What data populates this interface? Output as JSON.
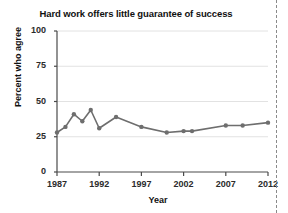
{
  "figure": {
    "title": "Hard work offers little guarantee of success",
    "page_edge": "dashed-page-border"
  },
  "chart_data": {
    "type": "line",
    "title": "Hard work offers little guarantee of success",
    "xlabel": "Year",
    "ylabel": "Percent who agree",
    "xlim": [
      1987,
      2012
    ],
    "ylim": [
      0,
      100
    ],
    "grid": true,
    "legend": "none",
    "line_color": "#6e6e6e",
    "marker": "circle",
    "xticks": [
      "1987",
      "1992",
      "1997",
      "2002",
      "2007",
      "2012"
    ],
    "xtick_values": [
      1987,
      1992,
      1997,
      2002,
      2007,
      2012
    ],
    "yticks": [
      "0",
      "25",
      "50",
      "75",
      "100"
    ],
    "ytick_values": [
      0,
      25,
      50,
      75,
      100
    ],
    "x": [
      1987,
      1988,
      1989,
      1990,
      1991,
      1992,
      1994,
      1997,
      2000,
      2002,
      2003,
      2007,
      2009,
      2012
    ],
    "values": [
      28,
      32,
      41,
      36,
      44,
      31,
      39,
      32,
      28,
      29,
      29,
      33,
      33,
      35
    ],
    "series": [
      {
        "name": "Percent who agree",
        "points": [
          {
            "x": 1987,
            "y": 28
          },
          {
            "x": 1988,
            "y": 32
          },
          {
            "x": 1989,
            "y": 41
          },
          {
            "x": 1990,
            "y": 36
          },
          {
            "x": 1991,
            "y": 44
          },
          {
            "x": 1992,
            "y": 31
          },
          {
            "x": 1994,
            "y": 39
          },
          {
            "x": 1997,
            "y": 32
          },
          {
            "x": 2000,
            "y": 28
          },
          {
            "x": 2002,
            "y": 29
          },
          {
            "x": 2003,
            "y": 29
          },
          {
            "x": 2007,
            "y": 33
          },
          {
            "x": 2009,
            "y": 33
          },
          {
            "x": 2012,
            "y": 35
          }
        ]
      }
    ]
  }
}
